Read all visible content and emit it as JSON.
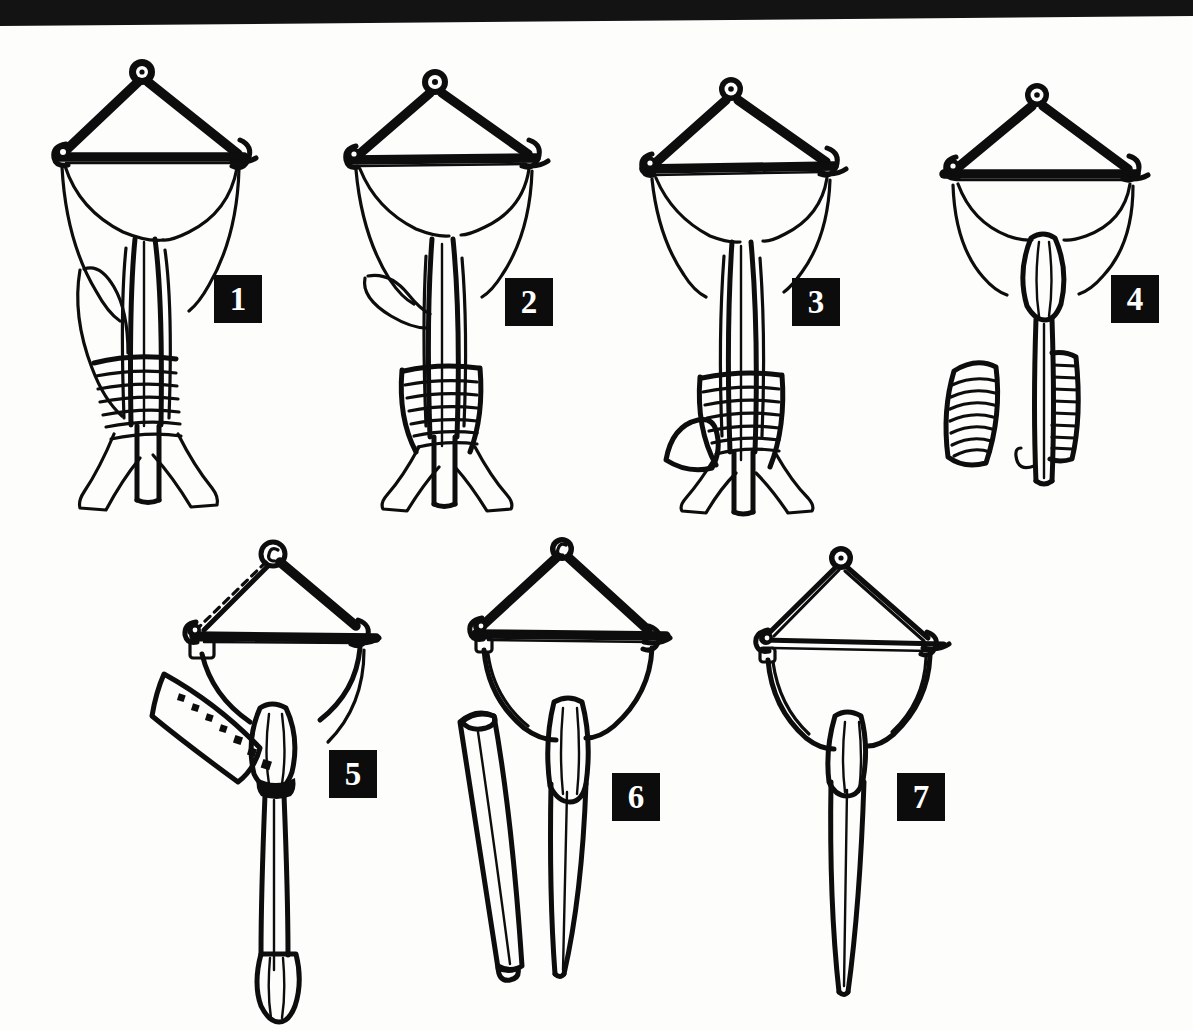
{
  "plate": {
    "title": "Seven-stage line drawing plate",
    "description": "Scanned black-and-white line illustration showing seven numbered specimens arranged in two rows, each with a triangular/diamond wishbone frame above an elongated body.",
    "background_color": "#fdfdfb",
    "ink_color": "#0d0d0d",
    "scan_edge_color": "#131313",
    "rows": [
      {
        "name": "top-row",
        "figure_numbers": [
          "1",
          "2",
          "3",
          "4"
        ]
      },
      {
        "name": "bottom-row",
        "figure_numbers": [
          "5",
          "6",
          "7"
        ]
      }
    ]
  },
  "figures": [
    {
      "number": "1",
      "name": "figure-1",
      "label_position": {
        "x": 215,
        "y": 250
      },
      "parts": [
        "apex-eyelet",
        "left-strut",
        "right-strut",
        "cross-bar",
        "left-horn",
        "right-horn",
        "funnel-membrane",
        "central-shaft",
        "side-blade",
        "banded-sheath",
        "forked-base"
      ],
      "notes": "Most complete specimen: broad funnel membrane, long lateral blade on the left, transversely banded sheath low on the shaft, splayed forked base."
    },
    {
      "number": "2",
      "name": "figure-2",
      "label_position": {
        "x": 506,
        "y": 253
      },
      "parts": [
        "apex-eyelet",
        "left-strut",
        "right-strut",
        "cross-bar",
        "left-horn",
        "right-horn",
        "funnel-membrane",
        "central-shaft",
        "side-blade",
        "banded-sheath",
        "forked-base"
      ],
      "notes": "Funnel membrane narrower; lateral blade shorter and set lower; banded sheath lower on the shaft."
    },
    {
      "number": "3",
      "name": "figure-3",
      "label_position": {
        "x": 793,
        "y": 253
      },
      "parts": [
        "apex-eyelet",
        "left-strut",
        "right-strut",
        "cross-bar",
        "left-horn",
        "right-horn",
        "funnel-membrane",
        "central-shaft",
        "detached-blade",
        "banded-sheath",
        "forked-base"
      ],
      "notes": "Lateral blade fully detached and lying free to the left of the shaft; banded sheath retained."
    },
    {
      "number": "4",
      "name": "figure-4",
      "label_position": {
        "x": 1112,
        "y": 250
      },
      "parts": [
        "apex-eyelet",
        "left-strut",
        "right-strut",
        "cross-bar",
        "left-horn",
        "right-horn",
        "funnel-membrane",
        "spindle-body",
        "plain-shaft",
        "detached-banded-sheath",
        "attached-banded-sheath",
        "hook-tip"
      ],
      "notes": "Funnel reduced to a narrow spindle; one banded sheath removed and drawn separately at the left; shaft tipped with a small hook."
    },
    {
      "number": "5",
      "name": "figure-5",
      "label_position": {
        "x": 330,
        "y": 751
      },
      "parts": [
        "apex-eyelet",
        "left-strut-dashed",
        "right-strut",
        "cross-bar",
        "left-horn-clasp",
        "right-horn",
        "stippled-paddle",
        "spindle-body",
        "collar",
        "long-shaft",
        "club-tip"
      ],
      "notes": "Left strut rendered as a broken/dashed line; a curved stippled paddle (row of dots) is hinged at the left clasp; shaft long and plain with a club-shaped tip."
    },
    {
      "number": "6",
      "name": "figure-6",
      "label_position": {
        "x": 613,
        "y": 748
      },
      "parts": [
        "apex-eyelet",
        "left-strut",
        "right-strut",
        "cross-bar",
        "left-horn-clasp",
        "right-horn",
        "bow-membrane",
        "spindle-body",
        "tapered-shaft",
        "detached-tube"
      ],
      "notes": "Frame reduced to struts plus a single bowed lower membrane; a hollow open-ended tube lies detached beside the tapering shaft."
    },
    {
      "number": "7",
      "name": "figure-7",
      "label_position": {
        "x": 898,
        "y": 748
      },
      "parts": [
        "apex-eyelet",
        "left-strut",
        "right-strut",
        "cross-bar",
        "left-horn-clasp",
        "right-horn",
        "bow-membrane",
        "spindle-body",
        "tapered-shaft"
      ],
      "notes": "Simplest specimen: bare diamond frame, thin struts, spindle body and a single long tapering shaft; no accessory parts."
    }
  ],
  "icons": {
    "eyelet": "ring-icon",
    "horn": "hook-icon",
    "numeral_plaque": "number-badge"
  }
}
